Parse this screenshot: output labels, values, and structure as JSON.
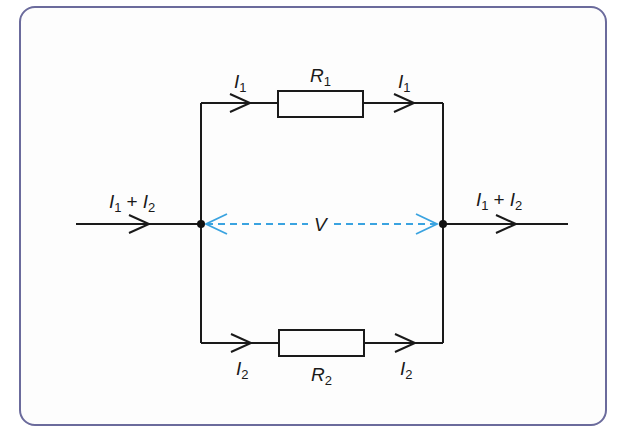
{
  "diagram": {
    "type": "parallel-circuit",
    "colors": {
      "frame": "#6b6b9c",
      "wire": "#1a1a1a",
      "voltage": "#3aa3e0"
    },
    "resistors": [
      {
        "name": "R",
        "sub": "1"
      },
      {
        "name": "R",
        "sub": "2"
      }
    ],
    "currents": {
      "top_left": {
        "name": "I",
        "sub": "1"
      },
      "top_right": {
        "name": "I",
        "sub": "1"
      },
      "bottom_left": {
        "name": "I",
        "sub": "2"
      },
      "bottom_right": {
        "name": "I",
        "sub": "2"
      },
      "input": {
        "a": "I",
        "a_sub": "1",
        "op": "+",
        "b": "I",
        "b_sub": "2"
      },
      "output": {
        "a": "I",
        "a_sub": "1",
        "op": "+",
        "b": "I",
        "b_sub": "2"
      }
    },
    "voltage_label": "V"
  }
}
